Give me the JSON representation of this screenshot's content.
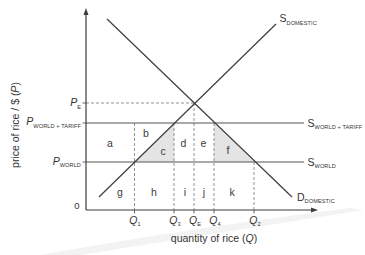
{
  "figure": {
    "y_axis_label": {
      "prefix": "price of rice / $ (",
      "var": "P",
      "suffix": ")"
    },
    "x_axis_label": {
      "prefix": "quantity of rice (",
      "var": "Q",
      "suffix": ")"
    },
    "origin_label": "0"
  },
  "price_levels": [
    {
      "symbol": "P",
      "subscript": "E"
    },
    {
      "symbol": "P",
      "subscript": "WORLD + TARIFF"
    },
    {
      "symbol": "P",
      "subscript": "WORLD"
    }
  ],
  "quantity_levels": [
    {
      "symbol": "Q",
      "subscript": "1"
    },
    {
      "symbol": "Q",
      "subscript": "3"
    },
    {
      "symbol": "Q",
      "subscript": "E"
    },
    {
      "symbol": "Q",
      "subscript": "4"
    },
    {
      "symbol": "Q",
      "subscript": "2"
    }
  ],
  "curves": {
    "supply_domestic": {
      "symbol": "S",
      "subscript": "DOMESTIC"
    },
    "supply_world_tariff": {
      "symbol": "S",
      "subscript": "WORLD + TARIFF"
    },
    "supply_world": {
      "symbol": "S",
      "subscript": "WORLD"
    },
    "demand_domestic": {
      "symbol": "D",
      "subscript": "DOMESTIC"
    }
  },
  "areas": [
    {
      "label": "a",
      "shaded": false
    },
    {
      "label": "b",
      "shaded": false
    },
    {
      "label": "c",
      "shaded": true
    },
    {
      "label": "d",
      "shaded": false
    },
    {
      "label": "e",
      "shaded": false
    },
    {
      "label": "f",
      "shaded": true
    },
    {
      "label": "g",
      "shaded": false
    },
    {
      "label": "h",
      "shaded": false
    },
    {
      "label": "i",
      "shaded": false
    },
    {
      "label": "j",
      "shaded": false
    },
    {
      "label": "k",
      "shaded": false
    }
  ],
  "colors": {
    "line": "#3d3d3d",
    "shade": "#e4e4e4",
    "text": "#333333",
    "background": "#ffffff"
  }
}
